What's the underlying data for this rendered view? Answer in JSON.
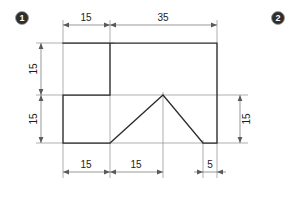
{
  "drawing": {
    "title": "Orthographic outline with stepped notch and V groove",
    "markers": [
      {
        "name": "marker-one",
        "label": "1",
        "cx": 22,
        "cy": 18
      },
      {
        "name": "marker-two",
        "label": "2",
        "cx": 278,
        "cy": 18
      }
    ],
    "outline": {
      "stroke_color": "#2b2b2b",
      "points": "63,43 110,43 110,95 63,95 63,143 110,143 163,95 203,143 217,143 217,43 110,43"
    },
    "dimensions": {
      "top": [
        {
          "name": "dim-top-15",
          "value": "15",
          "x1": 63,
          "x2": 110,
          "y": 25,
          "text_x": 86,
          "text_y": 18
        },
        {
          "name": "dim-top-35",
          "value": "35",
          "x1": 110,
          "x2": 217,
          "y": 25,
          "text_x": 163,
          "text_y": 18
        }
      ],
      "bottom": [
        {
          "name": "dim-bottom-15-left",
          "value": "15",
          "x1": 63,
          "x2": 110,
          "y": 172,
          "text_x": 86,
          "text_y": 165
        },
        {
          "name": "dim-bottom-15-mid",
          "value": "15",
          "x1": 110,
          "x2": 163,
          "y": 172,
          "text_x": 136,
          "text_y": 165
        },
        {
          "name": "dim-bottom-5-right",
          "value": "5",
          "x1": 203,
          "x2": 217,
          "y": 172,
          "text_x": 210,
          "text_y": 165
        }
      ],
      "left": [
        {
          "name": "dim-left-15-upper",
          "value": "15",
          "y1": 43,
          "y2": 95,
          "x": 41,
          "text_x": 34,
          "text_y": 69
        },
        {
          "name": "dim-left-15-lower",
          "value": "15",
          "y1": 95,
          "y2": 143,
          "x": 41,
          "text_x": 34,
          "text_y": 119
        }
      ],
      "right": [
        {
          "name": "dim-right-15",
          "value": "15",
          "y1": 95,
          "y2": 143,
          "x": 240,
          "text_x": 247,
          "text_y": 119
        }
      ]
    }
  }
}
